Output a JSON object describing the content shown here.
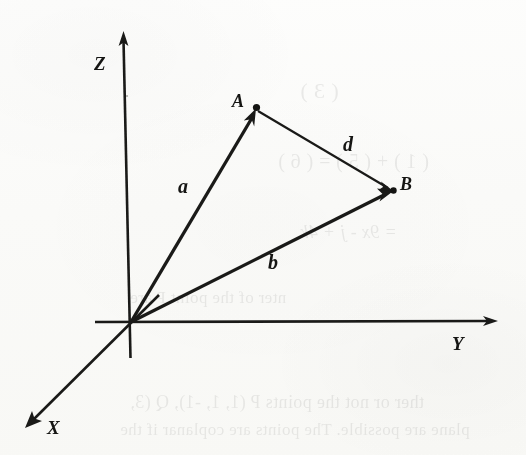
{
  "figure": {
    "kind": "3d-vector-diagram",
    "background_color": "#fdfdfc",
    "ink_color": "#1a1a18",
    "axes": [
      {
        "id": "x",
        "label": "X",
        "direction": "down-left",
        "origin": [
          131,
          322
        ],
        "tip": [
          25,
          428
        ],
        "label_pos": [
          47,
          418
        ]
      },
      {
        "id": "y",
        "label": "Y",
        "direction": "right",
        "origin": [
          131,
          322
        ],
        "tip": [
          497,
          321
        ],
        "label_pos": [
          452,
          334
        ]
      },
      {
        "id": "z",
        "label": "Z",
        "direction": "up",
        "origin": [
          131,
          322
        ],
        "tip": [
          123,
          32
        ],
        "label_pos": [
          94,
          54
        ]
      }
    ],
    "points": [
      {
        "id": "A",
        "label": "A",
        "pos": [
          256,
          109
        ],
        "label_pos": [
          232,
          92
        ]
      },
      {
        "id": "B",
        "label": "B",
        "pos": [
          394,
          191
        ],
        "label_pos": [
          400,
          175
        ]
      },
      {
        "id": "O",
        "label": "",
        "pos": [
          131,
          322
        ],
        "label_pos": [
          131,
          322
        ]
      }
    ],
    "vectors": [
      {
        "id": "a",
        "label": "a",
        "from": "O",
        "to": "A",
        "style": "bold",
        "label_pos": [
          178,
          176
        ]
      },
      {
        "id": "b",
        "label": "b",
        "from": "O",
        "to": "B",
        "style": "bold",
        "label_pos": [
          268,
          252
        ]
      },
      {
        "id": "d",
        "label": "d",
        "from": "A",
        "to": "B",
        "style": "thin",
        "label_pos": [
          343,
          134
        ]
      }
    ]
  },
  "ghost_text": {
    "note": "faint mirrored bleed-through from the reverse printed page",
    "lines": [
      {
        "text": "(  3  )",
        "x": 300,
        "y": 78,
        "size": 22,
        "italic": false
      },
      {
        "text": "(  1  ) + (  5  ) = (  6  )",
        "x": 278,
        "y": 150,
        "size": 20,
        "italic": false
      },
      {
        "text": "= 9x - j + 4k",
        "x": 300,
        "y": 222,
        "size": 18,
        "italic": true
      },
      {
        "text": "nter of the point P are",
        "x": 130,
        "y": 288,
        "size": 17,
        "italic": false
      },
      {
        "text": "ther or not the points  P (1, 1, -1),  Q (3,",
        "x": 130,
        "y": 392,
        "size": 18,
        "italic": false
      },
      {
        "text": "plane are possible. The points are coplanar if the",
        "x": 120,
        "y": 420,
        "size": 17,
        "italic": false
      }
    ]
  }
}
